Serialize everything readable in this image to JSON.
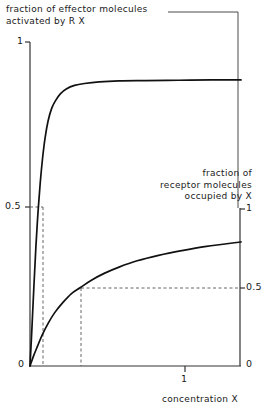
{
  "chart_data": {
    "type": "line",
    "title": "",
    "subtitle": "",
    "xlabel": "concentration X",
    "ylabel_left": "fraction of effector molecules activated by R X",
    "ylabel_right": "fraction of receptor molecules occupied by X",
    "xlim": [
      0,
      1.28
    ],
    "ylim_left": [
      0,
      1
    ],
    "ylim_right": [
      0,
      1
    ],
    "x_ticks": [
      1
    ],
    "x_tick_labels": [
      "1"
    ],
    "y_left_ticks": [
      0,
      0.5,
      1
    ],
    "y_left_tick_labels": [
      "0",
      "0.5",
      "1"
    ],
    "y_right_ticks": [
      0,
      0.5,
      1
    ],
    "y_right_tick_labels": [
      "0",
      "0.5",
      "1"
    ],
    "grid": false,
    "legend": "none",
    "annotations": [
      {
        "name": "effector-half-max-guide",
        "type": "dashed",
        "x": 0.077,
        "y_left": 0.5
      },
      {
        "name": "receptor-half-max-guide",
        "type": "dashed",
        "x": 0.306,
        "y_right": 0.5
      }
    ],
    "series": [
      {
        "name": "fraction of effector molecules activated by R X",
        "axis": "left",
        "points": [
          [
            0.0,
            0.0
          ],
          [
            0.012,
            0.12
          ],
          [
            0.024,
            0.25
          ],
          [
            0.036,
            0.37
          ],
          [
            0.048,
            0.47
          ],
          [
            0.062,
            0.565
          ],
          [
            0.077,
            0.645
          ],
          [
            0.092,
            0.706
          ],
          [
            0.11,
            0.757
          ],
          [
            0.132,
            0.796
          ],
          [
            0.156,
            0.82
          ],
          [
            0.184,
            0.84
          ],
          [
            0.22,
            0.855
          ],
          [
            0.27,
            0.866
          ],
          [
            0.33,
            0.872
          ],
          [
            0.42,
            0.877
          ],
          [
            0.54,
            0.88
          ],
          [
            0.7,
            0.881
          ],
          [
            0.9,
            0.882
          ],
          [
            1.1,
            0.883
          ],
          [
            1.28,
            0.883
          ]
        ]
      },
      {
        "name": "fraction of receptor molecules occupied by X",
        "axis": "right",
        "points": [
          [
            0.0,
            0.0
          ],
          [
            0.02,
            0.06
          ],
          [
            0.045,
            0.125
          ],
          [
            0.075,
            0.2
          ],
          [
            0.11,
            0.272
          ],
          [
            0.15,
            0.34
          ],
          [
            0.2,
            0.405
          ],
          [
            0.25,
            0.46
          ],
          [
            0.306,
            0.5
          ],
          [
            0.37,
            0.545
          ],
          [
            0.45,
            0.59
          ],
          [
            0.54,
            0.63
          ],
          [
            0.65,
            0.67
          ],
          [
            0.78,
            0.705
          ],
          [
            0.92,
            0.735
          ],
          [
            1.07,
            0.762
          ],
          [
            1.28,
            0.79
          ]
        ]
      }
    ]
  },
  "labels": {
    "effector_line1": "fraction of effector molecules",
    "effector_line2": "activated by R X",
    "receptor_line1": "fraction of",
    "receptor_line2": "receptor molecules",
    "receptor_line3": "occupied by X",
    "x_axis": "concentration X",
    "left_1": "1",
    "left_05": "0.5",
    "left_0": "0",
    "right_1": "1",
    "right_05": "0.5",
    "right_0": "0",
    "x_tick_1": "1"
  },
  "style": {
    "curve_color": "#111111",
    "axis_color": "#333333",
    "dash_color": "#555555",
    "background": "#ffffff"
  }
}
